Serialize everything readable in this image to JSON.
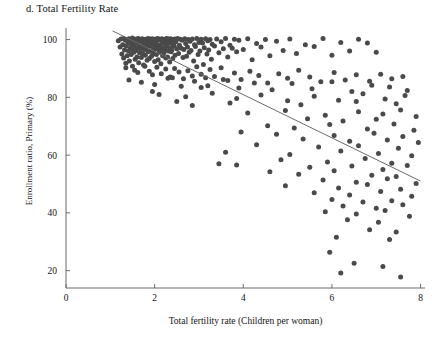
{
  "chart_data": {
    "type": "scatter",
    "title": "d. Total Fertility Rate",
    "xlabel": "Total fertility rate (Children per woman)",
    "ylabel": "Enrollment ratio, Primary (%)",
    "xlim": [
      0,
      8.1
    ],
    "ylim": [
      14,
      104
    ],
    "xticks": [
      0,
      2,
      4,
      6,
      8
    ],
    "xtick_labels": [
      "0",
      "2",
      "4",
      "6",
      "8"
    ],
    "yticks": [
      20,
      40,
      60,
      80,
      100
    ],
    "ytick_labels": [
      "20",
      "40",
      "60",
      "80",
      "100"
    ],
    "grid": false,
    "legend": "none",
    "marker_color": "#4a4a4a",
    "marker_size": 5,
    "axis_color": "#6b6b6b",
    "trendline": {
      "name": "linear fit",
      "color": "#6b6b6b",
      "x": [
        1.05,
        8.0
      ],
      "y": [
        103.0,
        51.0
      ]
    },
    "points": [
      [
        1.18,
        99.6
      ],
      [
        1.22,
        97.4
      ],
      [
        1.24,
        100.2
      ],
      [
        1.26,
        95.0
      ],
      [
        1.28,
        98.2
      ],
      [
        1.3,
        100.4
      ],
      [
        1.3,
        93.6
      ],
      [
        1.32,
        96.4
      ],
      [
        1.34,
        99.8
      ],
      [
        1.35,
        91.8
      ],
      [
        1.36,
        97.8
      ],
      [
        1.38,
        100.0
      ],
      [
        1.38,
        94.4
      ],
      [
        1.4,
        98.6
      ],
      [
        1.41,
        96.0
      ],
      [
        1.42,
        100.3
      ],
      [
        1.43,
        92.6
      ],
      [
        1.44,
        99.0
      ],
      [
        1.45,
        97.0
      ],
      [
        1.46,
        100.1
      ],
      [
        1.47,
        94.8
      ],
      [
        1.48,
        98.4
      ],
      [
        1.49,
        96.6
      ],
      [
        1.5,
        100.5
      ],
      [
        1.5,
        90.8
      ],
      [
        1.52,
        99.2
      ],
      [
        1.53,
        95.6
      ],
      [
        1.54,
        97.6
      ],
      [
        1.55,
        100.0
      ],
      [
        1.56,
        93.2
      ],
      [
        1.57,
        98.8
      ],
      [
        1.58,
        96.2
      ],
      [
        1.59,
        100.2
      ],
      [
        1.6,
        94.0
      ],
      [
        1.61,
        99.4
      ],
      [
        1.62,
        97.2
      ],
      [
        1.63,
        100.4
      ],
      [
        1.64,
        92.0
      ],
      [
        1.65,
        98.0
      ],
      [
        1.66,
        95.4
      ],
      [
        1.67,
        100.1
      ],
      [
        1.68,
        96.8
      ],
      [
        1.69,
        99.6
      ],
      [
        1.7,
        93.8
      ],
      [
        1.71,
        97.4
      ],
      [
        1.72,
        100.3
      ],
      [
        1.73,
        95.2
      ],
      [
        1.74,
        98.6
      ],
      [
        1.75,
        91.2
      ],
      [
        1.76,
        99.9
      ],
      [
        1.77,
        96.6
      ],
      [
        1.78,
        100.0
      ],
      [
        1.79,
        94.6
      ],
      [
        1.8,
        98.2
      ],
      [
        1.81,
        97.0
      ],
      [
        1.82,
        100.2
      ],
      [
        1.83,
        92.8
      ],
      [
        1.84,
        99.0
      ],
      [
        1.85,
        95.8
      ],
      [
        1.86,
        100.4
      ],
      [
        1.87,
        97.8
      ],
      [
        1.88,
        93.4
      ],
      [
        1.89,
        99.4
      ],
      [
        1.9,
        96.0
      ],
      [
        1.91,
        100.1
      ],
      [
        1.92,
        98.8
      ],
      [
        1.93,
        94.2
      ],
      [
        1.94,
        97.6
      ],
      [
        1.95,
        100.3
      ],
      [
        1.96,
        95.0
      ],
      [
        1.97,
        99.2
      ],
      [
        1.98,
        96.4
      ],
      [
        1.99,
        100.0
      ],
      [
        2.0,
        92.4
      ],
      [
        2.01,
        98.4
      ],
      [
        2.02,
        97.2
      ],
      [
        2.03,
        100.2
      ],
      [
        2.04,
        94.8
      ],
      [
        2.05,
        99.6
      ],
      [
        2.06,
        96.8
      ],
      [
        2.07,
        100.4
      ],
      [
        2.08,
        93.0
      ],
      [
        2.09,
        98.0
      ],
      [
        2.1,
        95.6
      ],
      [
        2.11,
        100.1
      ],
      [
        2.12,
        97.4
      ],
      [
        2.13,
        99.8
      ],
      [
        2.14,
        91.6
      ],
      [
        2.15,
        96.2
      ],
      [
        2.16,
        100.3
      ],
      [
        2.17,
        98.6
      ],
      [
        2.18,
        94.4
      ],
      [
        2.19,
        97.0
      ],
      [
        2.2,
        100.0
      ],
      [
        2.21,
        95.4
      ],
      [
        2.22,
        99.4
      ],
      [
        2.23,
        96.6
      ],
      [
        2.24,
        100.2
      ],
      [
        2.25,
        93.6
      ],
      [
        2.26,
        98.2
      ],
      [
        2.27,
        97.6
      ],
      [
        2.28,
        100.4
      ],
      [
        2.29,
        94.0
      ],
      [
        2.3,
        99.0
      ],
      [
        2.31,
        96.0
      ],
      [
        2.32,
        100.1
      ],
      [
        2.33,
        98.8
      ],
      [
        2.34,
        92.2
      ],
      [
        2.35,
        97.2
      ],
      [
        2.36,
        100.3
      ],
      [
        2.37,
        95.8
      ],
      [
        2.38,
        99.6
      ],
      [
        2.39,
        96.4
      ],
      [
        2.4,
        100.0
      ],
      [
        2.41,
        93.4
      ],
      [
        2.42,
        98.4
      ],
      [
        2.44,
        97.8
      ],
      [
        2.45,
        100.2
      ],
      [
        2.46,
        94.6
      ],
      [
        2.48,
        99.2
      ],
      [
        2.5,
        96.8
      ],
      [
        2.52,
        100.4
      ],
      [
        2.54,
        95.2
      ],
      [
        2.56,
        98.0
      ],
      [
        2.58,
        100.1
      ],
      [
        2.6,
        97.0
      ],
      [
        2.62,
        99.8
      ],
      [
        2.64,
        93.8
      ],
      [
        2.66,
        96.6
      ],
      [
        2.68,
        100.3
      ],
      [
        2.7,
        98.6
      ],
      [
        2.72,
        94.2
      ],
      [
        2.74,
        97.4
      ],
      [
        2.76,
        100.0
      ],
      [
        2.78,
        95.6
      ],
      [
        2.8,
        99.4
      ],
      [
        2.82,
        96.2
      ],
      [
        2.85,
        100.2
      ],
      [
        2.88,
        92.6
      ],
      [
        2.9,
        98.2
      ],
      [
        2.92,
        97.6
      ],
      [
        2.95,
        100.4
      ],
      [
        2.98,
        94.8
      ],
      [
        3.0,
        99.0
      ],
      [
        3.02,
        96.0
      ],
      [
        3.05,
        100.1
      ],
      [
        3.08,
        98.8
      ],
      [
        3.1,
        91.4
      ],
      [
        3.12,
        97.2
      ],
      [
        3.15,
        100.3
      ],
      [
        3.18,
        95.0
      ],
      [
        3.2,
        99.6
      ],
      [
        3.22,
        96.4
      ],
      [
        3.25,
        100.0
      ],
      [
        3.28,
        93.2
      ],
      [
        3.3,
        98.4
      ],
      [
        3.35,
        97.8
      ],
      [
        3.4,
        100.2
      ],
      [
        3.45,
        95.4
      ],
      [
        3.5,
        99.2
      ],
      [
        3.55,
        96.8
      ],
      [
        3.6,
        100.4
      ],
      [
        3.65,
        94.0
      ],
      [
        3.7,
        98.0
      ],
      [
        3.75,
        97.0
      ],
      [
        3.8,
        100.1
      ],
      [
        3.85,
        95.8
      ],
      [
        3.9,
        99.8
      ],
      [
        4.0,
        96.6
      ],
      [
        4.1,
        100.3
      ],
      [
        4.2,
        93.0
      ],
      [
        4.3,
        98.6
      ],
      [
        4.4,
        97.4
      ],
      [
        4.5,
        100.0
      ],
      [
        4.6,
        94.4
      ],
      [
        4.75,
        99.4
      ],
      [
        4.9,
        96.2
      ],
      [
        5.05,
        100.2
      ],
      [
        5.2,
        95.2
      ],
      [
        5.4,
        98.2
      ],
      [
        5.6,
        97.6
      ],
      [
        5.8,
        100.4
      ],
      [
        6.0,
        94.6
      ],
      [
        6.2,
        99.0
      ],
      [
        6.4,
        96.0
      ],
      [
        6.6,
        100.1
      ],
      [
        6.8,
        98.8
      ],
      [
        7.0,
        95.6
      ],
      [
        1.35,
        90.2
      ],
      [
        1.55,
        89.4
      ],
      [
        1.62,
        88.6
      ],
      [
        1.78,
        90.8
      ],
      [
        1.88,
        89.0
      ],
      [
        1.95,
        87.8
      ],
      [
        2.05,
        90.4
      ],
      [
        2.15,
        88.2
      ],
      [
        2.25,
        89.8
      ],
      [
        2.35,
        87.0
      ],
      [
        2.45,
        90.0
      ],
      [
        2.55,
        88.8
      ],
      [
        2.65,
        86.4
      ],
      [
        2.75,
        89.2
      ],
      [
        2.85,
        87.4
      ],
      [
        2.95,
        90.6
      ],
      [
        3.05,
        88.0
      ],
      [
        3.15,
        86.8
      ],
      [
        3.25,
        89.6
      ],
      [
        3.35,
        87.2
      ],
      [
        3.5,
        90.2
      ],
      [
        3.65,
        85.8
      ],
      [
        3.8,
        88.4
      ],
      [
        3.95,
        86.2
      ],
      [
        4.15,
        89.0
      ],
      [
        4.35,
        87.6
      ],
      [
        4.55,
        85.0
      ],
      [
        4.8,
        88.2
      ],
      [
        5.0,
        86.6
      ],
      [
        5.25,
        89.4
      ],
      [
        5.5,
        87.0
      ],
      [
        5.75,
        85.4
      ],
      [
        6.05,
        88.6
      ],
      [
        6.3,
        86.0
      ],
      [
        6.55,
        87.8
      ],
      [
        6.85,
        85.6
      ],
      [
        7.1,
        88.0
      ],
      [
        7.35,
        86.4
      ],
      [
        7.6,
        87.2
      ],
      [
        1.42,
        86.0
      ],
      [
        1.7,
        85.2
      ],
      [
        2.0,
        84.4
      ],
      [
        2.3,
        86.6
      ],
      [
        2.6,
        83.8
      ],
      [
        2.9,
        85.6
      ],
      [
        3.2,
        84.0
      ],
      [
        3.55,
        86.2
      ],
      [
        3.9,
        83.2
      ],
      [
        4.25,
        85.0
      ],
      [
        4.65,
        82.6
      ],
      [
        5.1,
        84.8
      ],
      [
        5.55,
        83.0
      ],
      [
        6.0,
        85.4
      ],
      [
        6.45,
        82.0
      ],
      [
        6.9,
        84.2
      ],
      [
        7.3,
        83.6
      ],
      [
        7.7,
        82.4
      ],
      [
        2.1,
        81.0
      ],
      [
        2.7,
        80.2
      ],
      [
        3.3,
        81.4
      ],
      [
        3.85,
        79.6
      ],
      [
        4.4,
        80.8
      ],
      [
        5.0,
        78.8
      ],
      [
        5.6,
        80.4
      ],
      [
        6.15,
        79.0
      ],
      [
        6.7,
        81.2
      ],
      [
        7.2,
        79.4
      ],
      [
        7.65,
        80.6
      ],
      [
        3.7,
        78.0
      ],
      [
        5.3,
        77.4
      ],
      [
        6.55,
        78.6
      ],
      [
        7.45,
        77.8
      ],
      [
        4.1,
        74.6
      ],
      [
        4.95,
        75.4
      ],
      [
        5.85,
        73.8
      ],
      [
        6.6,
        75.0
      ],
      [
        7.15,
        74.2
      ],
      [
        7.55,
        75.6
      ],
      [
        7.9,
        73.4
      ],
      [
        5.45,
        72.6
      ],
      [
        6.25,
        71.8
      ],
      [
        7.0,
        72.4
      ],
      [
        4.55,
        70.2
      ],
      [
        5.15,
        69.4
      ],
      [
        5.95,
        70.6
      ],
      [
        6.8,
        69.0
      ],
      [
        7.4,
        70.8
      ],
      [
        7.85,
        68.6
      ],
      [
        3.95,
        68.0
      ],
      [
        4.75,
        67.2
      ],
      [
        6.05,
        66.8
      ],
      [
        6.95,
        67.6
      ],
      [
        7.6,
        66.4
      ],
      [
        5.35,
        65.6
      ],
      [
        6.4,
        64.8
      ],
      [
        7.25,
        65.2
      ],
      [
        7.95,
        64.4
      ],
      [
        4.3,
        63.6
      ],
      [
        5.7,
        62.8
      ],
      [
        6.6,
        63.2
      ],
      [
        7.5,
        62.4
      ],
      [
        3.6,
        61.0
      ],
      [
        5.05,
        60.2
      ],
      [
        6.2,
        61.4
      ],
      [
        7.05,
        60.6
      ],
      [
        7.8,
        59.8
      ],
      [
        4.85,
        58.4
      ],
      [
        5.9,
        57.6
      ],
      [
        6.75,
        58.8
      ],
      [
        7.35,
        57.2
      ],
      [
        3.85,
        56.6
      ],
      [
        5.5,
        55.8
      ],
      [
        6.45,
        56.2
      ],
      [
        7.15,
        55.0
      ],
      [
        7.7,
        56.4
      ],
      [
        4.6,
        54.2
      ],
      [
        5.25,
        53.4
      ],
      [
        6.05,
        54.6
      ],
      [
        6.9,
        53.0
      ],
      [
        7.45,
        52.6
      ],
      [
        5.8,
        51.4
      ],
      [
        6.55,
        50.6
      ],
      [
        7.25,
        51.8
      ],
      [
        7.9,
        50.2
      ],
      [
        4.95,
        49.4
      ],
      [
        6.15,
        48.6
      ],
      [
        6.8,
        49.8
      ],
      [
        7.55,
        48.2
      ],
      [
        5.6,
        47.0
      ],
      [
        6.4,
        46.2
      ],
      [
        7.1,
        47.4
      ],
      [
        7.8,
        45.8
      ],
      [
        6.0,
        44.6
      ],
      [
        6.7,
        43.8
      ],
      [
        7.35,
        44.2
      ],
      [
        6.25,
        42.4
      ],
      [
        7.0,
        41.6
      ],
      [
        7.6,
        42.8
      ],
      [
        5.85,
        40.4
      ],
      [
        6.55,
        39.6
      ],
      [
        7.2,
        40.8
      ],
      [
        7.75,
        38.8
      ],
      [
        6.35,
        37.6
      ],
      [
        7.05,
        36.8
      ],
      [
        6.85,
        34.2
      ],
      [
        7.45,
        33.4
      ],
      [
        6.1,
        31.6
      ],
      [
        7.3,
        30.8
      ],
      [
        5.95,
        26.4
      ],
      [
        6.5,
        22.6
      ],
      [
        7.15,
        21.4
      ],
      [
        7.55,
        17.8
      ],
      [
        6.2,
        19.2
      ],
      [
        3.45,
        57.0
      ],
      [
        2.85,
        77.2
      ],
      [
        2.5,
        78.6
      ],
      [
        3.05,
        83.4
      ],
      [
        1.95,
        82.0
      ],
      [
        2.4,
        86.8
      ]
    ]
  }
}
